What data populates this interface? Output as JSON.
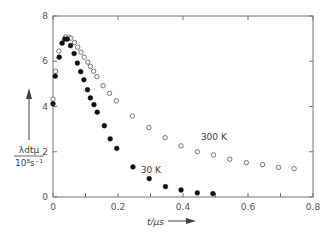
{
  "chart_data": {
    "type": "scatter",
    "title": "",
    "xlabel": "t/μs",
    "ylabel": "λdtμ / 10⁸s⁻¹",
    "ylabel_numerator": "λdtμ",
    "ylabel_denominator": "10⁸s⁻¹",
    "xlim": [
      0,
      0.8
    ],
    "ylim": [
      0,
      8
    ],
    "x_ticks": [
      0,
      0.2,
      0.4,
      0.6,
      0.8
    ],
    "x_tick_labels": [
      "0",
      "0.2",
      "0.4",
      "0.6",
      "0.8"
    ],
    "x_minor_ticks": [
      0.1,
      0.3,
      0.5,
      0.7
    ],
    "y_ticks": [
      0,
      2,
      4,
      6,
      8
    ],
    "y_tick_labels": [
      "0",
      "2",
      "4",
      "6",
      "8"
    ],
    "grid": false,
    "legend": "none (inline labels)",
    "series": [
      {
        "name": "300 K",
        "marker": "open-circle",
        "label_position": [
          0.455,
          2.5
        ],
        "x": [
          0.0,
          0.008,
          0.018,
          0.039,
          0.049,
          0.055,
          0.066,
          0.076,
          0.086,
          0.096,
          0.107,
          0.115,
          0.125,
          0.135,
          0.154,
          0.174,
          0.195,
          0.244,
          0.295,
          0.345,
          0.394,
          0.444,
          0.494,
          0.544,
          0.595,
          0.645,
          0.694,
          0.742
        ],
        "y": [
          4.32,
          5.56,
          6.45,
          7.07,
          7.07,
          7.02,
          6.83,
          6.62,
          6.4,
          6.18,
          5.96,
          5.77,
          5.56,
          5.32,
          4.92,
          4.58,
          4.25,
          3.58,
          3.07,
          2.62,
          2.26,
          2.0,
          1.86,
          1.67,
          1.52,
          1.43,
          1.31,
          1.25
        ]
      },
      {
        "name": "30 K",
        "marker": "filled-circle",
        "label_position": [
          0.27,
          1.05
        ],
        "x": [
          0.0,
          0.007,
          0.019,
          0.028,
          0.036,
          0.044,
          0.054,
          0.065,
          0.075,
          0.085,
          0.095,
          0.106,
          0.115,
          0.126,
          0.136,
          0.158,
          0.176,
          0.196,
          0.246,
          0.296,
          0.346,
          0.394,
          0.444,
          0.492
        ],
        "y": [
          4.12,
          5.34,
          6.18,
          6.8,
          6.98,
          6.98,
          6.69,
          6.34,
          5.92,
          5.54,
          5.18,
          4.74,
          4.38,
          4.08,
          3.75,
          3.15,
          2.57,
          2.15,
          1.33,
          0.81,
          0.46,
          0.31,
          0.18,
          0.15
        ]
      }
    ]
  }
}
